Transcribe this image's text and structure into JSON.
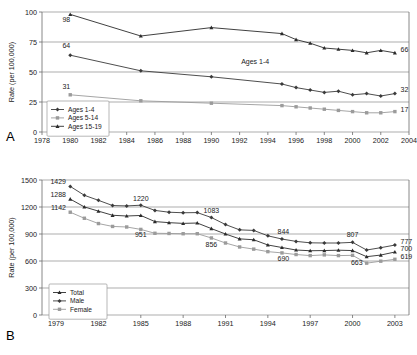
{
  "figure": {
    "panel_a_letter": "A",
    "panel_b_letter": "B"
  },
  "chart_data": [
    {
      "id": "panel-a",
      "type": "line",
      "title": "",
      "panel_label": "A",
      "xlabel": "",
      "ylabel": "Rate (per 100,000)",
      "xlim": [
        1978,
        2004
      ],
      "ylim": [
        0,
        100
      ],
      "xticks": [
        1978,
        1980,
        1982,
        1984,
        1986,
        1988,
        1990,
        1992,
        1994,
        1996,
        1998,
        2000,
        2002,
        2004
      ],
      "yticks": [
        0,
        25,
        50,
        75,
        100
      ],
      "grid": true,
      "legend_position": "bottom-left",
      "annotations": [
        {
          "text": "Ages 1-4",
          "x": 1993.1,
          "y": 57
        },
        {
          "text": "98",
          "x": 1980.0,
          "y": 92,
          "anchor": "end"
        },
        {
          "text": "64",
          "x": 1980.0,
          "y": 70,
          "anchor": "end"
        },
        {
          "text": "31",
          "x": 1980.0,
          "y": 36,
          "anchor": "end"
        },
        {
          "text": "66",
          "x": 2003.4,
          "y": 67,
          "anchor": "start"
        },
        {
          "text": "32",
          "x": 2003.4,
          "y": 33,
          "anchor": "start"
        },
        {
          "text": "17",
          "x": 2003.4,
          "y": 17,
          "anchor": "start"
        }
      ],
      "x": [
        1980,
        1985,
        1990,
        1995,
        1996,
        1997,
        1998,
        1999,
        2000,
        2001,
        2002,
        2003
      ],
      "series": [
        {
          "name": "Ages 15-19",
          "marker": "triangle",
          "color": "#2b2b2b",
          "values": [
            98,
            80,
            87,
            82,
            77,
            74,
            70,
            69,
            68,
            66,
            68,
            66
          ]
        },
        {
          "name": "Ages 1-4",
          "marker": "diamond",
          "color": "#3a3a3a",
          "values": [
            64,
            51,
            46,
            40,
            37,
            35,
            33,
            34,
            31,
            32,
            30,
            32
          ]
        },
        {
          "name": "Ages 5-14",
          "marker": "square",
          "color": "#9b9b9b",
          "values": [
            31,
            26,
            24,
            22,
            21,
            20,
            19,
            18,
            17,
            16,
            16,
            17
          ]
        }
      ],
      "legend_entries": [
        "Ages 1-4",
        "Ages 5-14",
        "Ages 15-19"
      ]
    },
    {
      "id": "panel-b",
      "type": "line",
      "title": "",
      "panel_label": "B",
      "xlabel": "",
      "ylabel": "Rate (per 100,000)",
      "xlim": [
        1978,
        2004
      ],
      "ylim": [
        0,
        1500
      ],
      "xticks": [
        1979,
        1982,
        1985,
        1988,
        1991,
        1994,
        1997,
        2000,
        2003
      ],
      "yticks": [
        0,
        300,
        600,
        900,
        1200,
        1500
      ],
      "grid": true,
      "legend_position": "bottom-left",
      "annotations": [
        {
          "text": "1429",
          "x": 1979.7,
          "y": 1452,
          "anchor": "end"
        },
        {
          "text": "1288",
          "x": 1979.7,
          "y": 1312,
          "anchor": "end"
        },
        {
          "text": "1142",
          "x": 1979.7,
          "y": 1172,
          "anchor": "end"
        },
        {
          "text": "1220",
          "x": 1985.0,
          "y": 1272,
          "anchor": "middle"
        },
        {
          "text": "951",
          "x": 1985.0,
          "y": 866,
          "anchor": "middle"
        },
        {
          "text": "1083",
          "x": 1990.0,
          "y": 1138,
          "anchor": "middle"
        },
        {
          "text": "856",
          "x": 1990.0,
          "y": 757,
          "anchor": "middle"
        },
        {
          "text": "844",
          "x": 1995.1,
          "y": 902,
          "anchor": "middle"
        },
        {
          "text": "690",
          "x": 1995.1,
          "y": 600,
          "anchor": "middle"
        },
        {
          "text": "807",
          "x": 2000.0,
          "y": 862,
          "anchor": "middle"
        },
        {
          "text": "663",
          "x": 2000.3,
          "y": 556,
          "anchor": "middle"
        },
        {
          "text": "777",
          "x": 2003.4,
          "y": 790,
          "anchor": "start"
        },
        {
          "text": "700",
          "x": 2003.4,
          "y": 706,
          "anchor": "start"
        },
        {
          "text": "619",
          "x": 2003.4,
          "y": 622,
          "anchor": "start"
        }
      ],
      "x": [
        1980,
        1981,
        1982,
        1983,
        1984,
        1985,
        1986,
        1987,
        1988,
        1989,
        1990,
        1991,
        1992,
        1993,
        1994,
        1995,
        1996,
        1997,
        1998,
        1999,
        2000,
        2001,
        2002,
        2003
      ],
      "series": [
        {
          "name": "Male",
          "marker": "diamond",
          "color": "#3a3a3a",
          "values": [
            1429,
            1330,
            1274,
            1216,
            1212,
            1220,
            1162,
            1142,
            1136,
            1138,
            1083,
            1005,
            946,
            940,
            880,
            844,
            818,
            802,
            800,
            800,
            807,
            722,
            748,
            777
          ]
        },
        {
          "name": "Total",
          "marker": "triangle",
          "color": "#2b2b2b",
          "values": [
            1288,
            1201,
            1154,
            1108,
            1100,
            1106,
            1038,
            1026,
            1018,
            1022,
            960,
            900,
            846,
            836,
            778,
            750,
            722,
            714,
            716,
            720,
            716,
            648,
            666,
            700
          ]
        },
        {
          "name": "Female",
          "marker": "square",
          "color": "#9b9b9b",
          "values": [
            1142,
            1075,
            1016,
            984,
            978,
            951,
            908,
            906,
            903,
            903,
            856,
            800,
            756,
            732,
            704,
            690,
            672,
            660,
            668,
            660,
            663,
            576,
            598,
            619
          ]
        }
      ],
      "legend_entries": [
        "Total",
        "Male",
        "Female"
      ]
    }
  ]
}
